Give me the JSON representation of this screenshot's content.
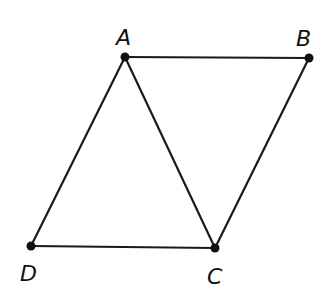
{
  "diagram": {
    "type": "geometry-figure",
    "stroke_color": "#1a1a1a",
    "points": [
      {
        "id": "A",
        "label": "A",
        "x": 125,
        "y": 57,
        "label_x": 116,
        "label_y": 45
      },
      {
        "id": "B",
        "label": "B",
        "x": 309,
        "y": 58,
        "label_x": 296,
        "label_y": 46
      },
      {
        "id": "C",
        "label": "C",
        "x": 215,
        "y": 248,
        "label_x": 207,
        "label_y": 284
      },
      {
        "id": "D",
        "label": "D",
        "x": 31,
        "y": 246,
        "label_x": 20,
        "label_y": 281
      }
    ],
    "segments": [
      {
        "from": "A",
        "to": "B"
      },
      {
        "from": "B",
        "to": "C"
      },
      {
        "from": "C",
        "to": "D"
      },
      {
        "from": "D",
        "to": "A"
      },
      {
        "from": "A",
        "to": "C"
      }
    ]
  }
}
